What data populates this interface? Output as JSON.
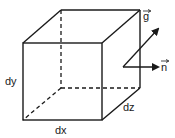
{
  "diagram": {
    "labels": {
      "dx": "dx",
      "dy": "dy",
      "dz": "dz",
      "g": "g",
      "n": "n"
    },
    "colors": {
      "stroke": "#1a1a1a",
      "background": "#ffffff"
    }
  }
}
